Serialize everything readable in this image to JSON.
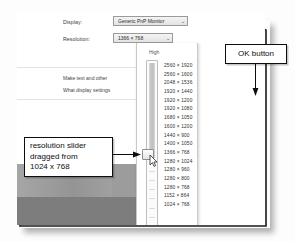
{
  "window": {
    "display_label": "Display:",
    "resolution_label": "Resolution:",
    "display_value": "Generic PnP Monitor",
    "resolution_value": "1366 × 768",
    "chevron": "⌄",
    "hint_line_1": "Make text and other",
    "hint_line_2": "What display settings",
    "ok_label": "OK",
    "cancel_label": "Ca"
  },
  "slider": {
    "high_label": "High",
    "low_label": "Low",
    "selected": "1366 × 768",
    "dragged_from": "1024 x 768"
  },
  "resolutions": [
    "2560 × 1920",
    "2560 × 1600",
    "2048 × 1536",
    "1920 × 1440",
    "1920 × 1200",
    "1920 × 1080",
    "1680 × 1050",
    "1600 × 1200",
    "1440 × 900",
    "1400 × 1050",
    "1366 × 768",
    "1280 × 1024",
    "1280 × 960",
    "1280 × 800",
    "1280 × 768",
    "1152 × 864",
    "1024 × 768"
  ],
  "annotations": {
    "slider_callout_line_1": "resolution slider",
    "slider_callout_line_2": "dragged from",
    "slider_callout_line_3": "1024 x 768",
    "ok_callout": "OK button"
  },
  "colors": {
    "callout_border": "#0d0d0d",
    "wallpaper_upper": "#9c9c9c",
    "wallpaper_lower": "#7d7d7d"
  }
}
